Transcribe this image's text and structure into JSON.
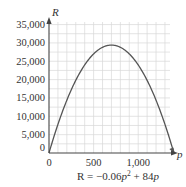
{
  "chart_data": {
    "type": "line",
    "title": "",
    "caption": "R = −0.06p² + 84p",
    "caption_parts": {
      "lhs": "R = −0.06",
      "var1": "p",
      "exp": "2",
      "mid": " + 84",
      "var2": "p"
    },
    "xlabel": "p",
    "ylabel": "R",
    "xlim": [
      0,
      1450
    ],
    "ylim": [
      0,
      35000
    ],
    "x_ticks": [
      0,
      500,
      1000
    ],
    "x_tick_labels": [
      "0",
      "500",
      "1,000"
    ],
    "y_ticks": [
      0,
      5000,
      10000,
      15000,
      20000,
      25000,
      30000,
      35000
    ],
    "y_tick_labels": [
      "0",
      "5,000",
      "10,000",
      "15,000",
      "20,000",
      "25,000",
      "30,000",
      "35,000"
    ],
    "grid": true,
    "grid_minor_x_step": 100,
    "grid_minor_y_step": 2500,
    "series": [
      {
        "name": "R = -0.06p^2 + 84p",
        "x": [
          0,
          100,
          200,
          300,
          400,
          500,
          600,
          700,
          800,
          900,
          1000,
          1100,
          1200,
          1300,
          1400
        ],
        "values": [
          0,
          7800,
          14400,
          19800,
          24000,
          27000,
          28800,
          29400,
          28800,
          27000,
          24000,
          19800,
          14400,
          7800,
          0
        ]
      }
    ],
    "vertex": {
      "p": 700,
      "R": 29400
    },
    "colors": {
      "curve": "#555555",
      "axis": "#444444",
      "grid": "#d9d9d9",
      "text": "#333333"
    }
  }
}
